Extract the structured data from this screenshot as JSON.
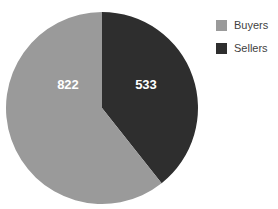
{
  "chart_data": {
    "type": "pie",
    "title": "",
    "categories": [
      "Buyers",
      "Sellers"
    ],
    "values": [
      822,
      533
    ],
    "labels": [
      "822",
      "533"
    ],
    "colors": [
      "#9a9a9a",
      "#2e2e2e"
    ],
    "legend_position": "right",
    "grid": false,
    "total": 1355,
    "start_angle_deg": 0,
    "direction": "clockwise",
    "series": [
      {
        "name": "Buyers",
        "value": 822,
        "color": "#9a9a9a",
        "label": "822"
      },
      {
        "name": "Sellers",
        "value": 533,
        "color": "#2e2e2e",
        "label": "533"
      }
    ]
  },
  "legend": {
    "items": [
      {
        "label": "Buyers",
        "color": "#9a9a9a"
      },
      {
        "label": "Sellers",
        "color": "#2e2e2e"
      }
    ]
  },
  "slices": {
    "buyers_label": "822",
    "sellers_label": "533"
  },
  "background": "#ffffff",
  "label_text_color": "#ffffff",
  "legend_text_color": "#3f3f3f"
}
